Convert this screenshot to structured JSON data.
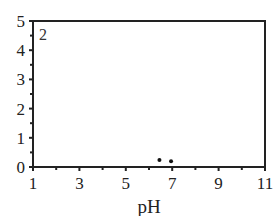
{
  "chart_data": {
    "type": "scatter",
    "title": "",
    "panel_label": "2",
    "xlabel": "pH",
    "ylabel": "",
    "xlim": [
      1,
      11
    ],
    "ylim": [
      0,
      5
    ],
    "x_ticks": [
      1,
      3,
      5,
      7,
      9,
      11
    ],
    "x_minor_ticks": [
      2,
      4,
      6,
      8,
      10
    ],
    "y_ticks": [
      0,
      1,
      2,
      3,
      4,
      5
    ],
    "y_minor_ticks": [
      0.5,
      1.5,
      2.5,
      3.5,
      4.5
    ],
    "grid": false,
    "legend": null,
    "series": [
      {
        "name": "data",
        "marker": "dot",
        "color": "#111111",
        "points": [
          {
            "x": 6.45,
            "y": 0.24
          },
          {
            "x": 6.95,
            "y": 0.2
          }
        ]
      }
    ]
  }
}
